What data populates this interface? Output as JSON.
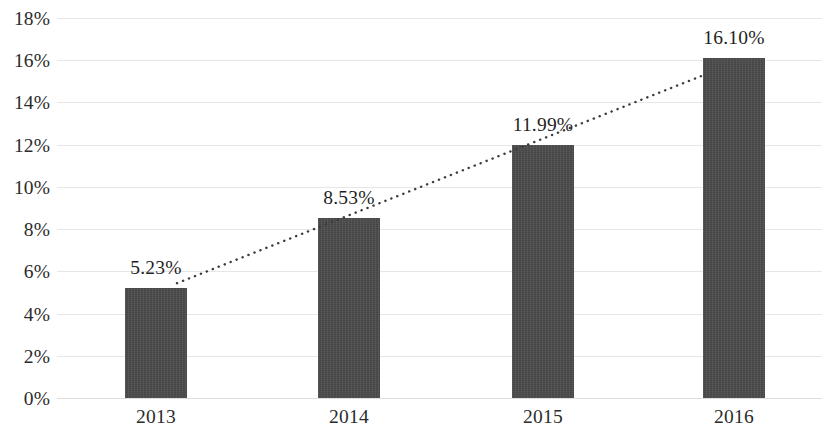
{
  "chart_data": {
    "type": "bar",
    "title": "",
    "subtitle": "",
    "xlabel": "",
    "ylabel": "",
    "categories": [
      "2013",
      "2014",
      "2015",
      "2016"
    ],
    "values": [
      5.23,
      8.53,
      11.99,
      16.1
    ],
    "value_labels": [
      "5.23%",
      "8.53%",
      "11.99%",
      "16.10%"
    ],
    "series": [
      {
        "name": "",
        "type": "bar",
        "values": [
          5.23,
          8.53,
          11.99,
          16.1
        ],
        "color": "#4b4b4b"
      },
      {
        "name": "",
        "type": "line",
        "style": "dotted",
        "color": "#3c3c3c",
        "values": [
          5.23,
          8.53,
          11.99,
          16.1
        ]
      }
    ],
    "ylim": [
      0,
      18
    ],
    "ytick_step": 2,
    "ytick_labels": [
      "0%",
      "2%",
      "4%",
      "6%",
      "8%",
      "10%",
      "12%",
      "14%",
      "16%",
      "18%"
    ],
    "ytick_values": [
      0,
      2,
      4,
      6,
      8,
      10,
      12,
      14,
      16,
      18
    ],
    "grid": true,
    "grid_axis": "y",
    "grid_color": "#e6e6e6",
    "legend": false,
    "legend_position": "none",
    "background": "#ffffff",
    "units": "percent",
    "data_labels_shown": true,
    "trendline_shown": true
  }
}
